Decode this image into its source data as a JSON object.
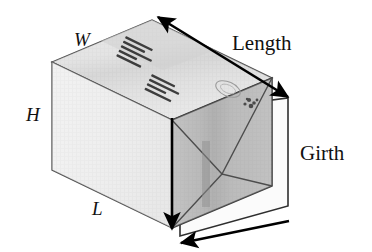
{
  "figure": {
    "labels": {
      "width": "W",
      "height": "H",
      "length_side": "L",
      "length_arrow": "Length",
      "girth_arrow": "Girth"
    },
    "colors": {
      "background": "#ffffff",
      "top_face": "#dcdcdc",
      "top_face_shade": "#cccccc",
      "front_face": "#e6e6e6",
      "end_face": "#aaaaaa",
      "end_face_shade": "#9a9a9a",
      "band": "#f4f4f4",
      "outline": "#3a3a3a",
      "arrow": "#000000",
      "text": "#111111"
    },
    "box_printing": {
      "block_1": "shipping label text",
      "block_2": "shipping label text",
      "stamp": "postal stamp mark"
    },
    "geometry": {
      "front_top_left": [
        52,
        62
      ],
      "front_bottom_left": [
        52,
        170
      ],
      "front_top_right": [
        172,
        120
      ],
      "front_bottom_right": [
        172,
        228
      ],
      "back_top_left": [
        152,
        20
      ],
      "back_top_right": [
        272,
        78
      ],
      "back_bottom_right": [
        272,
        186
      ]
    },
    "arrows": {
      "length": {
        "from": [
          158,
          17
        ],
        "to": [
          288,
          97
        ],
        "heads": "both",
        "label": "Length"
      },
      "girth_vertical": {
        "from": [
          172,
          120
        ],
        "to": [
          172,
          230
        ],
        "heads": "end"
      },
      "girth_bottom": {
        "from": [
          289,
          221
        ],
        "to": [
          181,
          243
        ],
        "heads": "end"
      }
    }
  }
}
